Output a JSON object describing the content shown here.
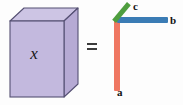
{
  "figure": {
    "type": "rank-one-tensor-decomposition-diagram",
    "background_color": "#fdfdfd"
  },
  "tensor": {
    "label": "x",
    "name": "tensor-x",
    "face_color": "#c3b9de",
    "top_color": "#cdc5e4",
    "side_color": "#b6aad4",
    "edge_color": "#555073"
  },
  "operator": {
    "symbol": "=",
    "name": "equals",
    "color": "#3b3b3b"
  },
  "vectors": [
    {
      "id": "a",
      "label": "a",
      "orientation": "vertical",
      "color": "#ef7762"
    },
    {
      "id": "b",
      "label": "b",
      "orientation": "horizontal",
      "color": "#3b7cb5"
    },
    {
      "id": "c",
      "label": "c",
      "orientation": "diagonal",
      "color": "#4f9e3f"
    }
  ]
}
